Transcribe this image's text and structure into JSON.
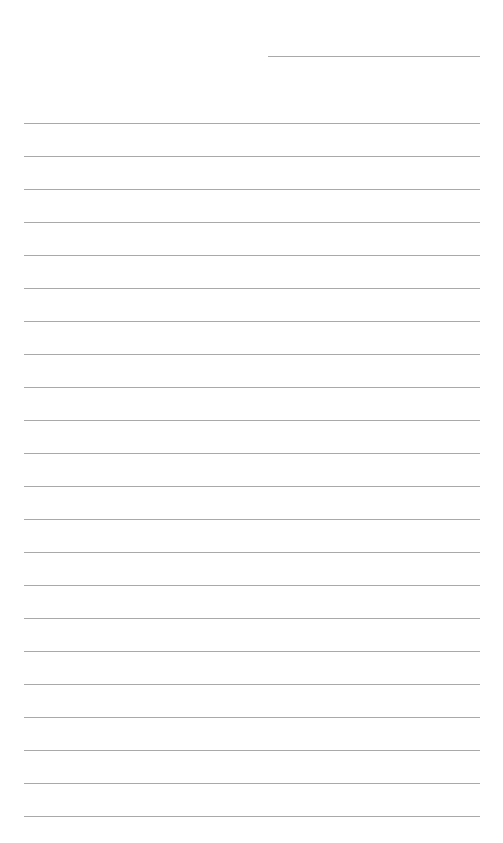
{
  "document": {
    "type": "blank ruled writing paper",
    "background_color": "#ffffff",
    "line_color": "#a9a9a9",
    "header_line": {
      "x": 268,
      "y": 56,
      "width": 212
    },
    "ruled_lines": {
      "count": 22,
      "first_y": 123,
      "spacing": 33,
      "x": 24,
      "width": 456
    }
  }
}
